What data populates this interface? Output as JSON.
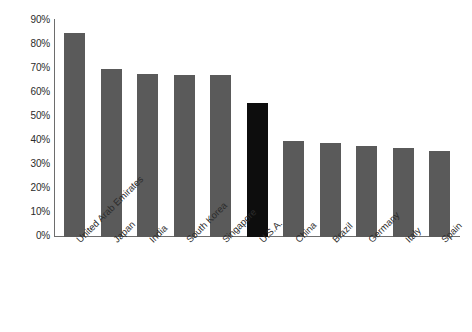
{
  "chart_data": {
    "type": "bar",
    "title": "",
    "subtitle": "",
    "xlabel": "",
    "ylabel": "",
    "ylim": [
      0,
      90
    ],
    "grid": false,
    "legend": false,
    "y_tick_labels": [
      "90%",
      "80%",
      "70%",
      "60%",
      "50%",
      "40%",
      "30%",
      "20%",
      "10%",
      "0%"
    ],
    "y_tick_values": [
      90,
      80,
      70,
      60,
      50,
      40,
      30,
      20,
      10,
      0
    ],
    "categories": [
      "United Arab Emirates",
      "Japan",
      "India",
      "South Korea",
      "Singapore",
      "U.S.A.",
      "China",
      "Brazil",
      "Germany",
      "Italy",
      "Spain"
    ],
    "values": [
      85,
      70,
      68,
      67.5,
      67.5,
      56,
      40,
      39,
      38,
      37,
      36
    ],
    "colors": {
      "bar_default": "#5a5a5a",
      "bar_highlight": "#0d0d0d",
      "axis": "#6d6d6d",
      "background": "#ffffff",
      "text": "#2b2b2b"
    },
    "highlighted_category": "U.S.A.",
    "bars": [
      {
        "label": "United Arab Emirates",
        "value": 85,
        "highlighted": false
      },
      {
        "label": "Japan",
        "value": 70,
        "highlighted": false
      },
      {
        "label": "India",
        "value": 68,
        "highlighted": false
      },
      {
        "label": "South Korea",
        "value": 67.5,
        "highlighted": false
      },
      {
        "label": "Singapore",
        "value": 67.5,
        "highlighted": false
      },
      {
        "label": "U.S.A.",
        "value": 56,
        "highlighted": true
      },
      {
        "label": "China",
        "value": 40,
        "highlighted": false
      },
      {
        "label": "Brazil",
        "value": 39,
        "highlighted": false
      },
      {
        "label": "Germany",
        "value": 38,
        "highlighted": false
      },
      {
        "label": "Italy",
        "value": 37,
        "highlighted": false
      },
      {
        "label": "Spain",
        "value": 36,
        "highlighted": false
      }
    ]
  }
}
